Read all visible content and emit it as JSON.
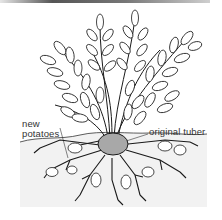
{
  "figure": {
    "labels": {
      "new_potatoes_line1": "new",
      "new_potatoes_line2": "potatoes",
      "original_tuber": "original tuber"
    },
    "colors": {
      "line": "#1a1a1a",
      "soil": "#f1f1f1",
      "tuber_fill": "#a8a8a8",
      "background": "#ffffff"
    }
  }
}
